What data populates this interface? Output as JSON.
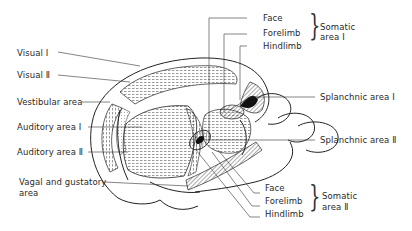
{
  "diagram": {
    "title": "",
    "left_labels": [
      {
        "id": "visual-1",
        "text": "Visual Ⅰ"
      },
      {
        "id": "visual-2",
        "text": "Visual Ⅱ"
      },
      {
        "id": "vestibular",
        "text": "Vestibular area"
      },
      {
        "id": "auditory-1",
        "text": "Auditory area Ⅰ"
      },
      {
        "id": "auditory-2",
        "text": "Auditory area Ⅱ"
      },
      {
        "id": "vagal-gustatory-line1",
        "text": "Vagal and gustatory"
      },
      {
        "id": "vagal-gustatory-line2",
        "text": "area"
      }
    ],
    "somatic_area_1": {
      "items": [
        "Face",
        "Forelimb",
        "Hindlimb"
      ],
      "group_label_line1": "Somatic",
      "group_label_line2": "area Ⅰ"
    },
    "right_labels": [
      {
        "id": "splanchnic-1",
        "text": "Splanchnic area Ⅰ"
      },
      {
        "id": "splanchnic-2",
        "text": "Splanchnic area Ⅱ"
      }
    ],
    "somatic_area_2": {
      "items": [
        "Face",
        "Forelimb",
        "Hindlimb"
      ],
      "group_label_line1": "Somatic",
      "group_label_line2": "area Ⅱ"
    }
  }
}
